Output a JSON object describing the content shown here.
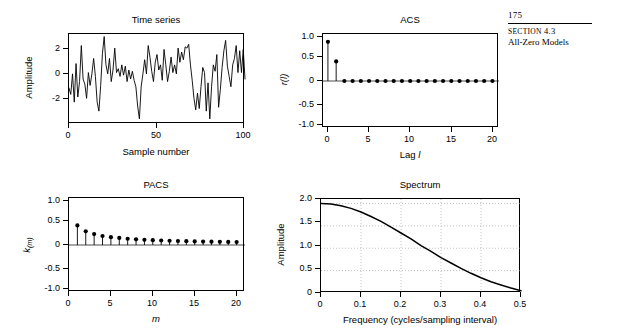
{
  "running_head": {
    "folio": "175",
    "section_label": "SECTION",
    "section_number": "4.3",
    "chapter_title": "All-Zero Models"
  },
  "panels": {
    "time_series": {
      "title": "Time series",
      "xlabel": "Sample number",
      "ylabel": "Amplitude",
      "yticks": [
        "2",
        "0",
        "-2"
      ],
      "xticks": [
        "0",
        "50",
        "100"
      ]
    },
    "acs": {
      "title": "ACS",
      "xlabel": "Lag l",
      "ylabel": "r(l)",
      "yticks": [
        "1.0",
        "0.5",
        "0",
        "-0.5",
        "-1.0"
      ],
      "xticks": [
        "0",
        "5",
        "10",
        "15",
        "20"
      ]
    },
    "pacs": {
      "title": "PACS",
      "xlabel": "m",
      "ylabel": "k(m)",
      "yticks": [
        "1.0",
        "0.5",
        "0",
        "-0.5",
        "-1.0"
      ],
      "xticks": [
        "0",
        "5",
        "10",
        "15",
        "20"
      ]
    },
    "spectrum": {
      "title": "Spectrum",
      "xlabel": "Frequency (cycles/sampling interval)",
      "ylabel": "Amplitude",
      "yticks": [
        "2.0",
        "1.5",
        "1.0",
        "0.5",
        "0"
      ],
      "xticks": [
        "0",
        "0.1",
        "0.2",
        "0.3",
        "0.4",
        "0.5"
      ]
    }
  },
  "chart_data": [
    {
      "type": "line",
      "id": "time-series",
      "title": "Time series",
      "xlabel": "Sample number",
      "ylabel": "Amplitude",
      "xlim": [
        0,
        100
      ],
      "ylim": [
        -3.6,
        3.4
      ],
      "xticks": [
        0,
        50,
        100
      ],
      "yticks": [
        -2,
        0,
        2
      ],
      "grid": false,
      "x": [
        0,
        1,
        2,
        3,
        4,
        5,
        6,
        7,
        8,
        9,
        10,
        11,
        12,
        13,
        14,
        15,
        16,
        17,
        18,
        19,
        20,
        21,
        22,
        23,
        24,
        25,
        26,
        27,
        28,
        29,
        30,
        31,
        32,
        33,
        34,
        35,
        36,
        37,
        38,
        39,
        40,
        41,
        42,
        43,
        44,
        45,
        46,
        47,
        48,
        49,
        50,
        51,
        52,
        53,
        54,
        55,
        56,
        57,
        58,
        59,
        60,
        61,
        62,
        63,
        64,
        65,
        66,
        67,
        68,
        69,
        70,
        71,
        72,
        73,
        74,
        75,
        76,
        77,
        78,
        79,
        80,
        81,
        82,
        83,
        84,
        85,
        86,
        87,
        88,
        89,
        90,
        91,
        92,
        93,
        94,
        95,
        96,
        97,
        98,
        99,
        100
      ],
      "values": [
        -0.8,
        -1.3,
        0.3,
        -1.9,
        1.1,
        -1.5,
        -0.3,
        2.5,
        -0.1,
        -0.5,
        -1.6,
        0.4,
        -0.6,
        0.3,
        1.5,
        0.1,
        -1.9,
        -2.6,
        -0.6,
        1.9,
        3.2,
        1.0,
        0.3,
        1.5,
        -0.3,
        0.6,
        2.3,
        0.4,
        0.7,
        0.1,
        1.0,
        0.2,
        0.9,
        -0.3,
        0.6,
        -0.1,
        0.5,
        -0.2,
        -0.7,
        -2.2,
        -3.2,
        -0.7,
        0.3,
        1.4,
        0.3,
        2.5,
        1.6,
        0.5,
        -0.3,
        1.2,
        1.8,
        0.6,
        1.0,
        -0.2,
        2.2,
        1.0,
        -0.3,
        0.5,
        1.6,
        0.4,
        1.0,
        0.3,
        2.3,
        1.2,
        2.0,
        1.4,
        2.4,
        2.3,
        2.6,
        1.0,
        -0.2,
        -1.6,
        -2.5,
        -1.2,
        -2.4,
        -0.7,
        0.8,
        0.4,
        -2.6,
        -0.4,
        -3.2,
        -0.7,
        1.0,
        0.5,
        1.8,
        -2.3,
        -0.9,
        0.8,
        2.1,
        2.9,
        0.9,
        0.1,
        -0.7,
        1.0,
        1.5,
        2.5,
        0.4,
        2.1,
        0.4,
        2.2,
        -0.1
      ]
    },
    {
      "type": "bar",
      "id": "acs",
      "subtype": "stem",
      "title": "ACS",
      "xlabel": "Lag l",
      "ylabel": "r(l)",
      "xlim": [
        -0.6,
        20.8
      ],
      "ylim": [
        -1.2,
        1.2
      ],
      "xticks": [
        0,
        5,
        10,
        15,
        20
      ],
      "yticks": [
        -1.0,
        -0.5,
        0,
        0.5,
        1.0
      ],
      "grid": false,
      "categories": [
        0,
        1,
        2,
        3,
        4,
        5,
        6,
        7,
        8,
        9,
        10,
        11,
        12,
        13,
        14,
        15,
        16,
        17,
        18,
        19,
        20
      ],
      "values": [
        1.0,
        0.5,
        0,
        0,
        0,
        0,
        0,
        0,
        0,
        0,
        0,
        0,
        0,
        0,
        0,
        0,
        0,
        0,
        0,
        0,
        0
      ]
    },
    {
      "type": "bar",
      "id": "pacs",
      "subtype": "stem",
      "title": "PACS",
      "xlabel": "m",
      "ylabel": "k(m)",
      "xlim": [
        0,
        21
      ],
      "ylim": [
        -1.2,
        1.2
      ],
      "xticks": [
        0,
        5,
        10,
        15,
        20
      ],
      "yticks": [
        -1.0,
        -0.5,
        0,
        0.5,
        1.0
      ],
      "grid": false,
      "categories": [
        1,
        2,
        3,
        4,
        5,
        6,
        7,
        8,
        9,
        10,
        11,
        12,
        13,
        14,
        15,
        16,
        17,
        18,
        19,
        20
      ],
      "values": [
        0.5,
        0.35,
        0.28,
        0.23,
        0.2,
        0.18,
        0.16,
        0.145,
        0.133,
        0.123,
        0.115,
        0.108,
        0.102,
        0.097,
        0.092,
        0.088,
        0.084,
        0.081,
        0.078,
        0.075
      ]
    },
    {
      "type": "line",
      "id": "spectrum",
      "title": "Spectrum",
      "xlabel": "Frequency (cycles/sampling interval)",
      "ylabel": "Amplitude",
      "xlim": [
        0,
        0.5
      ],
      "ylim": [
        0,
        2.1
      ],
      "xticks": [
        0,
        0.1,
        0.2,
        0.3,
        0.4,
        0.5
      ],
      "yticks": [
        0,
        0.5,
        1.0,
        1.5,
        2.0
      ],
      "grid": true,
      "x": [
        0,
        0.025,
        0.05,
        0.075,
        0.1,
        0.125,
        0.15,
        0.175,
        0.2,
        0.225,
        0.25,
        0.275,
        0.3,
        0.325,
        0.35,
        0.375,
        0.4,
        0.425,
        0.45,
        0.475,
        0.5
      ],
      "values": [
        2.0,
        1.99,
        1.95,
        1.89,
        1.81,
        1.71,
        1.6,
        1.47,
        1.34,
        1.21,
        1.06,
        0.93,
        0.79,
        0.67,
        0.55,
        0.44,
        0.34,
        0.25,
        0.18,
        0.11,
        0.05
      ]
    }
  ]
}
